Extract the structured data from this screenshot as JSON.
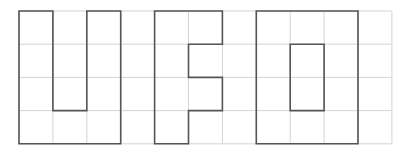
{
  "diagram": {
    "grid": {
      "columns": 11,
      "rows": 4,
      "origin_x": 19,
      "origin_y": 11,
      "cell_w": 33.9,
      "cell_h": 33.2,
      "line_color": "#d4d4d4"
    },
    "outline_color": "#555555",
    "letters": [
      {
        "name": "U",
        "polygons": [
          [
            [
              0,
              0
            ],
            [
              1,
              0
            ],
            [
              1,
              3
            ],
            [
              2,
              3
            ],
            [
              2,
              0
            ],
            [
              3,
              0
            ],
            [
              3,
              4
            ],
            [
              0,
              4
            ]
          ]
        ]
      },
      {
        "name": "F",
        "polygons": [
          [
            [
              4,
              0
            ],
            [
              6,
              0
            ],
            [
              6,
              1
            ],
            [
              5,
              1
            ],
            [
              5,
              2
            ],
            [
              6,
              2
            ],
            [
              6,
              3
            ],
            [
              5,
              3
            ],
            [
              5,
              4
            ],
            [
              4,
              4
            ]
          ]
        ]
      },
      {
        "name": "O",
        "polygons": [
          [
            [
              7,
              0
            ],
            [
              10,
              0
            ],
            [
              10,
              4
            ],
            [
              7,
              4
            ]
          ],
          [
            [
              8,
              1
            ],
            [
              9,
              1
            ],
            [
              9,
              3
            ],
            [
              8,
              3
            ]
          ]
        ]
      }
    ]
  }
}
